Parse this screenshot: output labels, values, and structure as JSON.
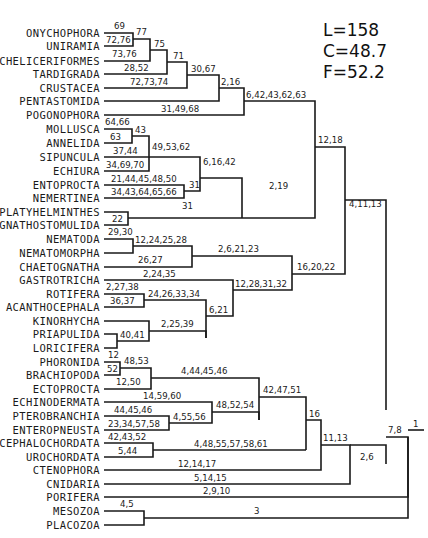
{
  "stats": {
    "L": "L=158",
    "C": "C=48.7",
    "F": "F=52.2"
  },
  "taxa": [
    {
      "name": "ONYCHOPHORA",
      "y": 33
    },
    {
      "name": "UNIRAMIA",
      "y": 46
    },
    {
      "name": "CHELICERIFORMES",
      "y": 61
    },
    {
      "name": "TARDIGRADA",
      "y": 74
    },
    {
      "name": "CRUSTACEA",
      "y": 88
    },
    {
      "name": "PENTASTOMIDA",
      "y": 101
    },
    {
      "name": "POGONOPHORA",
      "y": 115
    },
    {
      "name": "MOLLUSCA",
      "y": 129
    },
    {
      "name": "ANNELIDA",
      "y": 143
    },
    {
      "name": "SIPUNCULA",
      "y": 157
    },
    {
      "name": "ECHIURA",
      "y": 171
    },
    {
      "name": "ENTOPROCTA",
      "y": 185
    },
    {
      "name": "NEMERTINEA",
      "y": 198
    },
    {
      "name": "PLATYHELMINTHES",
      "y": 212
    },
    {
      "name": "GNATHOSTOMULIDA",
      "y": 225
    },
    {
      "name": "NEMATODA",
      "y": 239
    },
    {
      "name": "NEMATOMORPHA",
      "y": 253
    },
    {
      "name": "CHAETOGNATHA",
      "y": 267
    },
    {
      "name": "GASTROTRICHA",
      "y": 280
    },
    {
      "name": "ROTIFERA",
      "y": 294
    },
    {
      "name": "ACANTHOCEPHALA",
      "y": 307
    },
    {
      "name": "KINORHYCHA",
      "y": 321
    },
    {
      "name": "PRIAPULIDA",
      "y": 334
    },
    {
      "name": "LORICIFERA",
      "y": 348
    },
    {
      "name": "PHORONIDA",
      "y": 362
    },
    {
      "name": "BRACHIOPODA",
      "y": 375
    },
    {
      "name": "ECTOPROCTA",
      "y": 389
    },
    {
      "name": "ECHINODERMATA",
      "y": 402
    },
    {
      "name": "PTEROBRANCHIA",
      "y": 416
    },
    {
      "name": "ENTEROPNEUSTA",
      "y": 430
    },
    {
      "name": "CEPHALOCHORDATA",
      "y": 443
    },
    {
      "name": "UROCHORDATA",
      "y": 457
    },
    {
      "name": "CTENOPHORA",
      "y": 470
    },
    {
      "name": "CNIDARIA",
      "y": 484
    },
    {
      "name": "PORIFERA",
      "y": 497
    },
    {
      "name": "MESOZOA",
      "y": 511
    },
    {
      "name": "PLACOZOA",
      "y": 525
    }
  ],
  "edges": [
    "M104,33 H133 V46 H104",
    "M133,39 H150 V61 H104",
    "M150,50 H167 V74 H104",
    "M167,62 H187 V88 H104",
    "M187,75 H219 V101 H104",
    "M219,88 H244 V115 H104",
    "M244,101 H315 V178",
    "M104,129 H132 V143 H104",
    "M132,136 H149 V157 H104",
    "M149,157 V171 H104",
    "M149,157 H200 V178",
    "M104,185 H184 V198 H104",
    "M184,191 H200 V178",
    "M200,178 H242 V218",
    "M104,212 H128 V225 H104",
    "M128,218 H242",
    "M242,218 H315 V178",
    "M315,147 H345 V245",
    "M104,239 H133 V253 H104",
    "M133,246 H192 V267 H104",
    "M192,256 H292 V274",
    "M104,294 H144 V307 H104",
    "M144,300 H206 V338",
    "M104,334 H117 V348 H104",
    "M117,341 H149 V321 H104",
    "M149,331 H206 V338",
    "M104,280 H233 V310",
    "M206,316 H233 V310",
    "M233,290 H292 V274",
    "M292,274 H345 V245",
    "M345,200 H386 V410",
    "M104,362 H120 V375 H104",
    "M120,368 H151 V389 H104",
    "M151,378 H259 V420",
    "M104,416 H169 V430 H104",
    "M169,423 H212 V402 H104",
    "M212,412 H259 V420",
    "M259,397 H306 V450",
    "M104,443 H153 V457 H104",
    "M153,450 H306",
    "M306,420 H321 V470 H104",
    "M321,445 H350 V484 H104",
    "M350,445 H386 V464",
    "M386,437 H408 V497 H104",
    "M104,511 H144 V525 H104",
    "M144,518 H408 V437",
    "M408,430 H424"
  ],
  "branch_labels": [
    {
      "text": "69",
      "x": 114,
      "y": 29
    },
    {
      "text": "72,76",
      "x": 106,
      "y": 43
    },
    {
      "text": "77",
      "x": 136,
      "y": 35
    },
    {
      "text": "73,76",
      "x": 112,
      "y": 57
    },
    {
      "text": "75",
      "x": 154,
      "y": 47
    },
    {
      "text": "28,52",
      "x": 124,
      "y": 71
    },
    {
      "text": "71",
      "x": 173,
      "y": 59
    },
    {
      "text": "72,73,74",
      "x": 130,
      "y": 85
    },
    {
      "text": "30,67",
      "x": 191,
      "y": 72
    },
    {
      "text": "2,16",
      "x": 221,
      "y": 85
    },
    {
      "text": "6,42,43,62,63",
      "x": 246,
      "y": 98
    },
    {
      "text": "31,49,68",
      "x": 161,
      "y": 112
    },
    {
      "text": "64,66",
      "x": 105,
      "y": 125
    },
    {
      "text": "63",
      "x": 110,
      "y": 140
    },
    {
      "text": "43",
      "x": 135,
      "y": 133
    },
    {
      "text": "37,44",
      "x": 113,
      "y": 154
    },
    {
      "text": "49,53,62",
      "x": 152,
      "y": 150
    },
    {
      "text": "34,69,70",
      "x": 106,
      "y": 168
    },
    {
      "text": "21,44,45,48,50",
      "x": 111,
      "y": 182
    },
    {
      "text": "31",
      "x": 189,
      "y": 188
    },
    {
      "text": "6,16,42",
      "x": 203,
      "y": 165
    },
    {
      "text": "34,43,64,65,66",
      "x": 111,
      "y": 195
    },
    {
      "text": "31",
      "x": 182,
      "y": 209
    },
    {
      "text": "22",
      "x": 112,
      "y": 222
    },
    {
      "text": "2,19",
      "x": 269,
      "y": 189
    },
    {
      "text": "12,18",
      "x": 318,
      "y": 143
    },
    {
      "text": "4,11,13",
      "x": 349,
      "y": 207
    },
    {
      "text": "29,30",
      "x": 108,
      "y": 235
    },
    {
      "text": "12,24,25,28",
      "x": 135,
      "y": 243
    },
    {
      "text": "26,27",
      "x": 138,
      "y": 263
    },
    {
      "text": "2,6,21,23",
      "x": 218,
      "y": 252
    },
    {
      "text": "16,20,22",
      "x": 297,
      "y": 270
    },
    {
      "text": "2,24,35",
      "x": 143,
      "y": 277
    },
    {
      "text": "2,27,38",
      "x": 106,
      "y": 290
    },
    {
      "text": "36,37",
      "x": 110,
      "y": 304
    },
    {
      "text": "24,26,33,34",
      "x": 148,
      "y": 297
    },
    {
      "text": "12,28,31,32",
      "x": 235,
      "y": 287
    },
    {
      "text": "6,21",
      "x": 209,
      "y": 313
    },
    {
      "text": "2,25,39",
      "x": 161,
      "y": 327
    },
    {
      "text": "40,41",
      "x": 120,
      "y": 338
    },
    {
      "text": "12",
      "x": 108,
      "y": 358
    },
    {
      "text": "48,53",
      "x": 124,
      "y": 364
    },
    {
      "text": "52",
      "x": 107,
      "y": 372
    },
    {
      "text": "12,50",
      "x": 116,
      "y": 385
    },
    {
      "text": "4,44,45,46",
      "x": 181,
      "y": 374
    },
    {
      "text": "42,47,51",
      "x": 263,
      "y": 393
    },
    {
      "text": "14,59,60",
      "x": 143,
      "y": 399
    },
    {
      "text": "44,45,46",
      "x": 114,
      "y": 413
    },
    {
      "text": "48,52,54",
      "x": 216,
      "y": 408
    },
    {
      "text": "4,55,56",
      "x": 173,
      "y": 420
    },
    {
      "text": "23,34,57,58",
      "x": 108,
      "y": 427
    },
    {
      "text": "16",
      "x": 309,
      "y": 417
    },
    {
      "text": "42,43,52",
      "x": 108,
      "y": 440
    },
    {
      "text": "5,44",
      "x": 118,
      "y": 454
    },
    {
      "text": "4,48,55,57,58,61",
      "x": 194,
      "y": 447
    },
    {
      "text": "11,13",
      "x": 323,
      "y": 441
    },
    {
      "text": "12,14,17",
      "x": 178,
      "y": 467
    },
    {
      "text": "2,6",
      "x": 360,
      "y": 460
    },
    {
      "text": "7,8",
      "x": 388,
      "y": 433
    },
    {
      "text": "5,14,15",
      "x": 194,
      "y": 481
    },
    {
      "text": "1",
      "x": 413,
      "y": 427
    },
    {
      "text": "2,9,10",
      "x": 203,
      "y": 494
    },
    {
      "text": "4,5",
      "x": 120,
      "y": 507
    },
    {
      "text": "3",
      "x": 254,
      "y": 514
    }
  ]
}
